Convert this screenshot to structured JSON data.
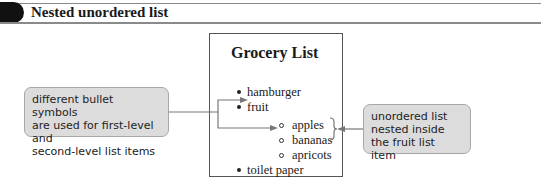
{
  "header": {
    "title": "Nested unordered list"
  },
  "page": {
    "heading": "Grocery List",
    "list": [
      {
        "label": "hamburger",
        "bullet": "disc"
      },
      {
        "label": "fruit",
        "bullet": "disc",
        "children": [
          {
            "label": "apples",
            "bullet": "circle"
          },
          {
            "label": "bananas",
            "bullet": "circle"
          },
          {
            "label": "apricots",
            "bullet": "circle"
          }
        ]
      },
      {
        "label": "toilet paper",
        "bullet": "disc"
      }
    ]
  },
  "callouts": {
    "left": {
      "lines": [
        "different bullet symbols",
        "are used for first-level and",
        "second-level list items"
      ]
    },
    "right": {
      "lines": [
        "unordered list",
        "nested inside",
        "the fruit list item"
      ]
    }
  },
  "colors": {
    "callout_fill": "#dcdcdc",
    "header_tab": "#111111",
    "arrow": "#777777"
  }
}
